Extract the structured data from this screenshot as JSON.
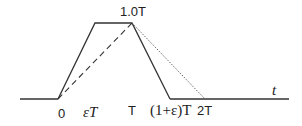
{
  "diagram": {
    "labels": {
      "peak": "1.0T",
      "origin": "0",
      "eps_t": "εT",
      "t_mark": "T",
      "one_plus_eps": "(1+ε)T",
      "two_t": "2T",
      "axis": "t"
    },
    "colors": {
      "line": "#333333",
      "background": "#ffffff"
    }
  }
}
